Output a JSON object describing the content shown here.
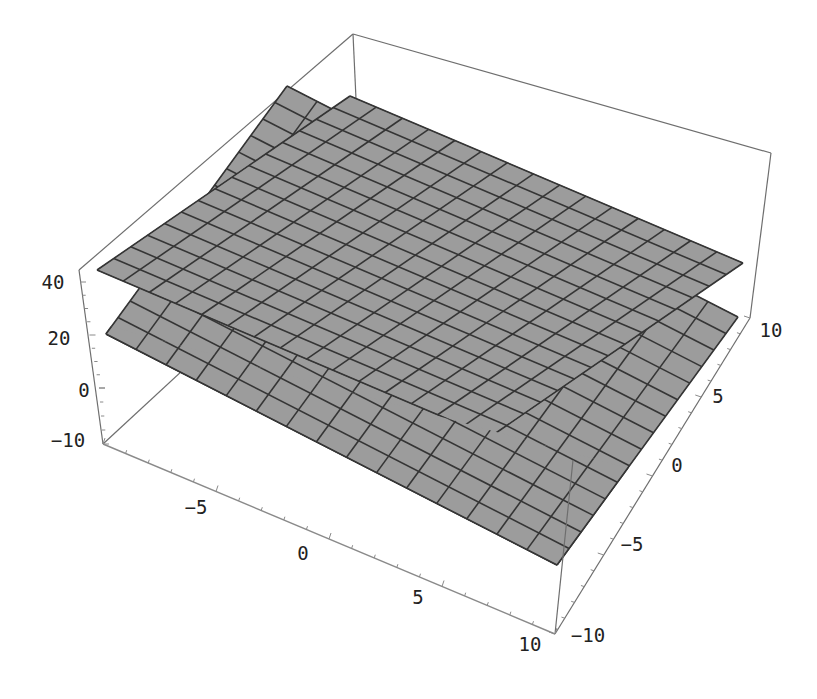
{
  "chart_data": {
    "type": "surface3d",
    "title": "",
    "x_axis": {
      "label": "",
      "range": [
        -10,
        10
      ],
      "ticks": [
        -10,
        -5,
        0,
        5,
        10
      ]
    },
    "y_axis": {
      "label": "",
      "range": [
        -10,
        10
      ],
      "ticks": [
        -10,
        -5,
        0,
        5,
        10
      ]
    },
    "z_axis": {
      "label": "",
      "range": [
        -21,
        45
      ],
      "ticks": [
        0,
        20,
        40
      ]
    },
    "mesh": {
      "plot_points": 15
    },
    "series": [
      {
        "name": "upper surface",
        "corners_z_estimate": {
          "x-10_y-10": 44,
          "x-10_y10": 40,
          "x10_y10": 22,
          "x10_y-10": 26
        }
      },
      {
        "name": "lower surface",
        "corners_z_estimate": {
          "x-10_y-10": 20,
          "x-10_y10": 40,
          "x10_y10": 22,
          "x10_y-10": 0
        }
      }
    ],
    "box": true,
    "grid": false,
    "legend": null,
    "colors": {
      "surface": "#9c9c9c",
      "mesh": "#353535",
      "box": "#6e6e6e",
      "background": "#ffffff"
    }
  },
  "labels": {
    "z_ticks": [
      "40",
      "20",
      "0"
    ],
    "x_ticks": [
      "-10",
      "-5",
      "0",
      "5",
      "10"
    ],
    "y_ticks": [
      "-10",
      "-5",
      "0",
      "5",
      "10"
    ]
  }
}
